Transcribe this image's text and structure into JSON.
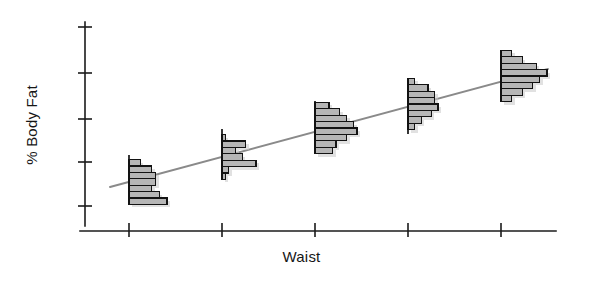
{
  "chart_data": {
    "type": "bar",
    "title": "",
    "subtitle": "",
    "xlabel": "Waist",
    "ylabel": "% Body Fat",
    "grid": false,
    "legend": null,
    "axes": {
      "x": {
        "label": "Waist",
        "tick_labels": [
          "",
          "",
          "",
          "",
          ""
        ],
        "tick_count": 5,
        "tick_positions_px": [
          129,
          222,
          315,
          408,
          501
        ],
        "axis_start_px": 80,
        "axis_end_px": 556,
        "axis_y_px": 231
      },
      "y": {
        "label": "% Body Fat",
        "tick_labels": [
          "",
          "",
          "",
          "",
          ""
        ],
        "tick_count": 5,
        "tick_positions_px": [
          27,
          73,
          119,
          162,
          206
        ],
        "axis_start_px": 22,
        "axis_end_px": 226,
        "axis_x_px": 85
      }
    },
    "regression_line": {
      "name": "fitted line",
      "color": "#8a8a8a",
      "x1_px": 110,
      "y1_px": 187,
      "x2_px": 548,
      "y2_px": 69
    },
    "series": [
      {
        "name": "Waist group 1",
        "x_px": 129,
        "center_y_px": 182,
        "bar_height_px": 6.4,
        "spine_top_px": 155,
        "spine_bottom_px": 202,
        "frequencies": [
          3,
          6,
          7,
          7,
          6,
          8,
          10
        ],
        "bar_max_px": 38
      },
      {
        "name": "Waist group 2",
        "x_px": 222,
        "center_y_px": 157,
        "bar_height_px": 6.4,
        "spine_top_px": 129,
        "spine_bottom_px": 176,
        "frequencies": [
          1,
          7,
          4,
          6,
          10,
          2,
          1
        ],
        "bar_max_px": 34
      },
      {
        "name": "Waist group 3",
        "x_px": 315,
        "center_y_px": 128,
        "bar_height_px": 6.4,
        "spine_top_px": 101,
        "spine_bottom_px": 150,
        "frequencies": [
          4,
          7,
          9,
          11,
          12,
          9,
          6,
          5
        ],
        "bar_max_px": 42
      },
      {
        "name": "Waist group 4",
        "x_px": 408,
        "center_y_px": 104,
        "bar_height_px": 6.4,
        "spine_top_px": 80,
        "spine_bottom_px": 134,
        "frequencies": [
          2,
          6,
          8,
          8,
          9,
          7,
          4,
          2
        ],
        "bar_max_px": 30
      },
      {
        "name": "Waist group 5",
        "x_px": 501,
        "center_y_px": 76,
        "bar_height_px": 6.4,
        "spine_top_px": 50,
        "spine_bottom_px": 100,
        "frequencies": [
          3,
          6,
          10,
          13,
          11,
          9,
          6,
          3
        ],
        "bar_max_px": 46
      }
    ],
    "colors": {
      "bar_fill": "#b6b6b6",
      "bar_stroke": "#131313",
      "axis": "#1b1b1b",
      "line": "#8a8a8a",
      "background": "#ffffff"
    }
  }
}
